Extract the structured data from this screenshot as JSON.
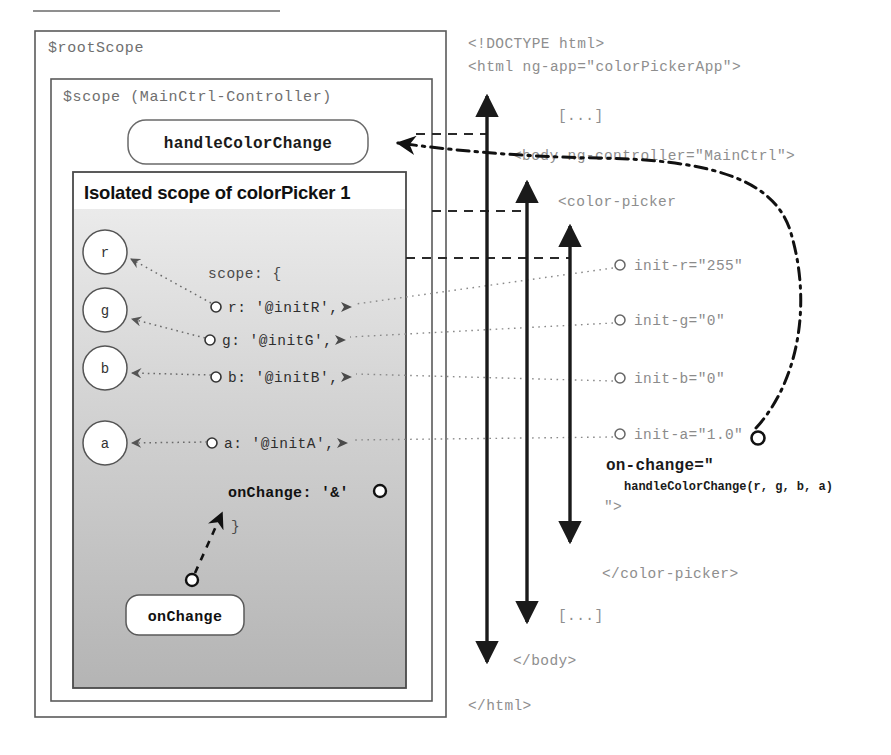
{
  "diagram": {
    "colors": {
      "outline": "#555555",
      "code_gray": "#8e8e8e",
      "gradient_top": "#ededed",
      "gradient_bottom": "#b8b8b8",
      "arrow_black": "#1a1a1a"
    },
    "scopes": {
      "root_label": "$rootScope",
      "controller_label": "$scope (MainCtrl-Controller)",
      "isolated_title": "Isolated scope of colorPicker 1"
    },
    "functions": {
      "handle_color_change": "handleColorChange",
      "on_change": "onChange"
    },
    "circles": [
      {
        "label": "r"
      },
      {
        "label": "g"
      },
      {
        "label": "b"
      },
      {
        "label": "a"
      }
    ],
    "scope_block": {
      "open": "scope: {",
      "close": "}",
      "props": [
        {
          "text": "r: '@initR',"
        },
        {
          "text": "g: '@initG',"
        },
        {
          "text": "b: '@initB',"
        },
        {
          "text": "a: '@initA',"
        }
      ],
      "on_change_prop": "onChange: '&'"
    },
    "code": {
      "doctype": "<!DOCTYPE html>",
      "html_open": "<html ng-app=\"colorPickerApp\">",
      "ellipsis_top": "[...]",
      "body_open": "<body ng-controller=\"MainCtrl\">",
      "color_picker_open": "<color-picker",
      "attributes": [
        {
          "text": "init-r=\"255\""
        },
        {
          "text": "init-g=\"0\""
        },
        {
          "text": "init-b=\"0\""
        },
        {
          "text": "init-a=\"1.0\""
        }
      ],
      "on_change_attr": "on-change=\"",
      "on_change_call": "handleColorChange(r, g, b, a)",
      "on_change_close": "\">",
      "color_picker_close": "</color-picker>",
      "ellipsis_bottom": "[...]",
      "body_close": "</body>",
      "html_close": "</html>"
    }
  }
}
